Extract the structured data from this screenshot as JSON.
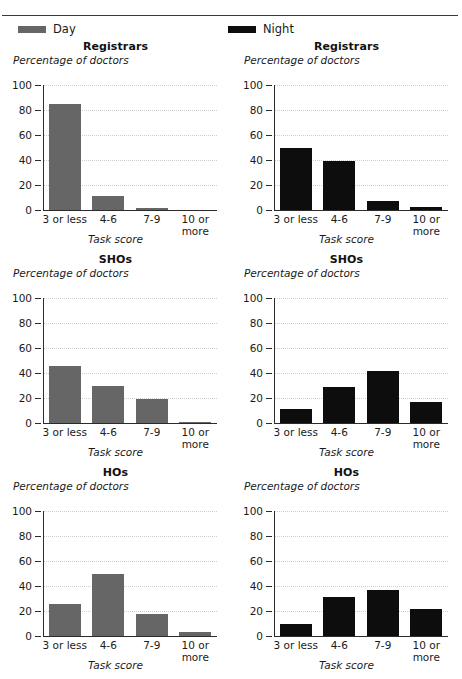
{
  "figure": {
    "legend": [
      {
        "label": "Day",
        "color": "#666666",
        "swatch_name": "day-color-swatch"
      },
      {
        "label": "Night",
        "color": "#0d0d0d",
        "swatch_name": "night-color-swatch"
      }
    ],
    "y_axis_label": "Percentage of doctors",
    "x_axis_label": "Task score",
    "y_ticks": [
      "0",
      "20",
      "40",
      "60",
      "80",
      "100"
    ],
    "categories": [
      "3 or less",
      "4-6",
      "7-9",
      "10 or\nmore"
    ]
  },
  "chart_data": [
    {
      "type": "bar",
      "title": "Registrars",
      "series_name": "Day",
      "color": "#666666",
      "categories": [
        "3 or less",
        "4-6",
        "7-9",
        "10 or more"
      ],
      "values": [
        85,
        11,
        2,
        0
      ],
      "xlabel": "Task score",
      "ylabel": "Percentage of doctors",
      "ylim": [
        0,
        100
      ],
      "yticks": [
        0,
        20,
        40,
        60,
        80,
        100
      ],
      "grid": true,
      "legend_position": "top-left"
    },
    {
      "type": "bar",
      "title": "Registrars",
      "series_name": "Night",
      "color": "#0d0d0d",
      "categories": [
        "3 or less",
        "4-6",
        "7-9",
        "10 or more"
      ],
      "values": [
        50,
        39,
        7,
        2.5
      ],
      "xlabel": "Task score",
      "ylabel": "Percentage of doctors",
      "ylim": [
        0,
        100
      ],
      "yticks": [
        0,
        20,
        40,
        60,
        80,
        100
      ],
      "grid": true,
      "legend_position": "top-right"
    },
    {
      "type": "bar",
      "title": "SHOs",
      "series_name": "Day",
      "color": "#666666",
      "categories": [
        "3 or less",
        "4-6",
        "7-9",
        "10 or more"
      ],
      "values": [
        46,
        30,
        19,
        1
      ],
      "xlabel": "Task score",
      "ylabel": "Percentage of doctors",
      "ylim": [
        0,
        100
      ],
      "yticks": [
        0,
        20,
        40,
        60,
        80,
        100
      ],
      "grid": true
    },
    {
      "type": "bar",
      "title": "SHOs",
      "series_name": "Night",
      "color": "#0d0d0d",
      "categories": [
        "3 or less",
        "4-6",
        "7-9",
        "10 or more"
      ],
      "values": [
        11,
        29,
        42,
        16.5
      ],
      "xlabel": "Task score",
      "ylabel": "Percentage of doctors",
      "ylim": [
        0,
        100
      ],
      "yticks": [
        0,
        20,
        40,
        60,
        80,
        100
      ],
      "grid": true
    },
    {
      "type": "bar",
      "title": "HOs",
      "series_name": "Day",
      "color": "#666666",
      "categories": [
        "3 or less",
        "4-6",
        "7-9",
        "10 or more"
      ],
      "values": [
        26,
        50,
        18,
        3.5
      ],
      "xlabel": "Task score",
      "ylabel": "Percentage of doctors",
      "ylim": [
        0,
        100
      ],
      "yticks": [
        0,
        20,
        40,
        60,
        80,
        100
      ],
      "grid": true
    },
    {
      "type": "bar",
      "title": "HOs",
      "series_name": "Night",
      "color": "#0d0d0d",
      "categories": [
        "3 or less",
        "4-6",
        "7-9",
        "10 or more"
      ],
      "values": [
        10,
        31,
        37,
        22
      ],
      "xlabel": "Task score",
      "ylabel": "Percentage of doctors",
      "ylim": [
        0,
        100
      ],
      "yticks": [
        0,
        20,
        40,
        60,
        80,
        100
      ],
      "grid": true
    }
  ]
}
